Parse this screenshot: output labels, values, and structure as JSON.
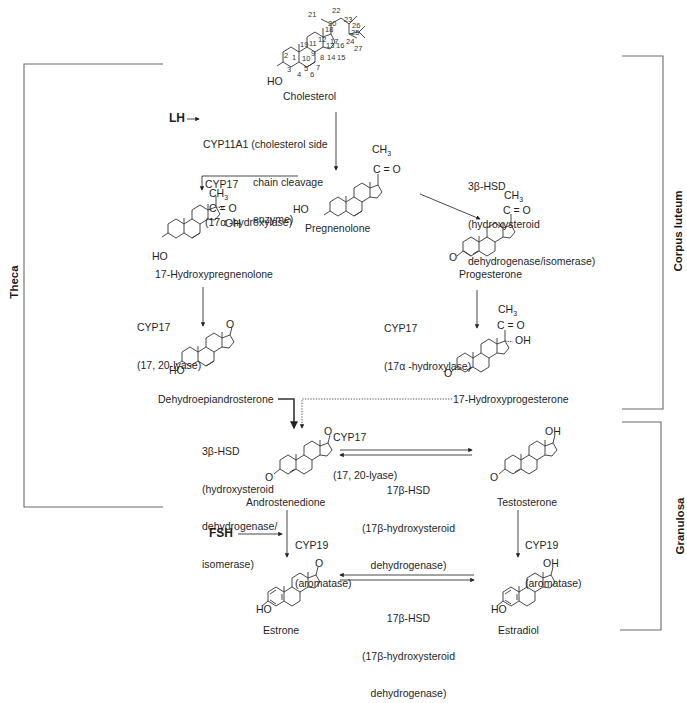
{
  "regions": [
    {
      "id": "theca",
      "label": "Theca"
    },
    {
      "id": "corpus_luteum",
      "label": "Corpus luteum"
    },
    {
      "id": "granulosa",
      "label": "Granulosa"
    }
  ],
  "hormones": {
    "lh": "LH",
    "fsh": "FSH"
  },
  "compounds": {
    "cholesterol": "Cholesterol",
    "pregnenolone": "Pregnenolone",
    "hydroxypregnenolone": "17-Hydroxypregnenolone",
    "progesterone": "Progesterone",
    "dhea": "Dehydroepiandrosterone",
    "hydroxyprogesterone": "17-Hydroxyprogesterone",
    "androstenedione": "Androstenedione",
    "testosterone": "Testosterone",
    "estrone": "Estrone",
    "estradiol": "Estradiol"
  },
  "enzymes": {
    "cyp11a1": {
      "line1": "CYP11A1 (cholesterol side",
      "line2": "chain cleavage",
      "line3": "enzyme)"
    },
    "cyp17_hydroxylase_left": {
      "line1": "CYP17",
      "line2": "(17α -hydroxylase)"
    },
    "hsd3b_top": {
      "line1": "3β-HSD",
      "line2": "(hydroxysteroid",
      "line3": "dehydrogenase/isomerase)"
    },
    "cyp17_lyase_left": {
      "line1": "CYP17",
      "line2": "(17, 20-lyase)"
    },
    "cyp17_hydroxylase_right": {
      "line1": "CYP17",
      "line2": "(17α -hydroxylase)"
    },
    "cyp17_lyase_mid": {
      "line1": "CYP17",
      "line2": "(17, 20-lyase)"
    },
    "hsd3b_mid": {
      "line1": "3β-HSD",
      "line2": "(hydroxysteroid",
      "line3": "dehydrogenase/",
      "line4": "isomerase)"
    },
    "hsd17b_top": {
      "line1": "17β-HSD",
      "line2": "(17β-hydroxysteroid",
      "line3": "dehydrogenase)"
    },
    "cyp19_left": {
      "line1": "CYP19",
      "line2": "(aromatase)"
    },
    "cyp19_right": {
      "line1": "CYP19",
      "line2": "(aromatase)"
    },
    "hsd17b_bottom": {
      "line1": "17β-HSD",
      "line2": "(17β-hydroxysteroid",
      "line3": "dehydrogenase)"
    }
  },
  "atoms": {
    "ho": "HO",
    "o": "O",
    "oh": "OH",
    "ch3": "CH",
    "ch3_sub": "3",
    "co": "C = O"
  },
  "cholesterol_numbering": [
    "1",
    "2",
    "3",
    "4",
    "5",
    "6",
    "7",
    "8",
    "9",
    "10",
    "11",
    "12",
    "13",
    "14",
    "15",
    "16",
    "17",
    "18",
    "19",
    "20",
    "21",
    "22",
    "23",
    "24",
    "25",
    "26",
    "27"
  ],
  "colors": {
    "line": "#3a3a3a",
    "bracket": "#6a6a6a",
    "text": "#1f1f1f"
  }
}
